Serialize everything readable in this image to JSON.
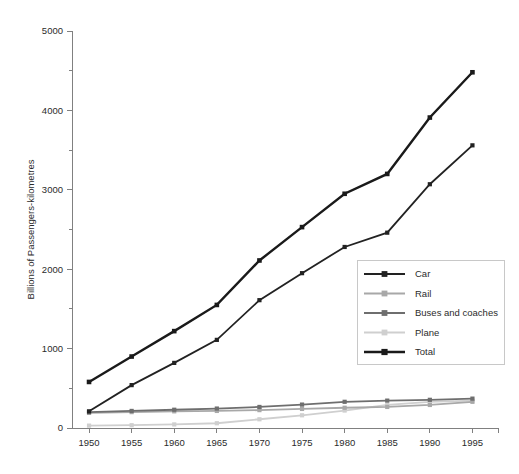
{
  "chart_data": {
    "type": "line",
    "title": "",
    "subtitle": "",
    "xlabel": "",
    "ylabel": "Billions of Passengers-kilometres",
    "x": [
      1950,
      1955,
      1960,
      1965,
      1970,
      1975,
      1980,
      1985,
      1990,
      1995
    ],
    "categories": [
      "1950",
      "1955",
      "1960",
      "1965",
      "1970",
      "1975",
      "1980",
      "1985",
      "1990",
      "1995"
    ],
    "xlim": [
      1948,
      1998
    ],
    "ylim": [
      0,
      5000
    ],
    "y_major_ticks": [
      0,
      1000,
      2000,
      3000,
      4000,
      5000
    ],
    "y_major_tick_labels": [
      "0",
      "1000",
      "2000",
      "3000",
      "4000",
      "5000"
    ],
    "y_minor_ticks": [
      500,
      1500,
      2500,
      3500,
      4500
    ],
    "x_ticks": [
      1950,
      1955,
      1960,
      1965,
      1970,
      1975,
      1980,
      1985,
      1990,
      1995,
      1998
    ],
    "x_tick_labels": [
      "1950",
      "1955",
      "1960",
      "1965",
      "1970",
      "1975",
      "1980",
      "1985",
      "1990",
      "1995",
      ""
    ],
    "grid": false,
    "legend_position": "center-right",
    "marker": "square",
    "series": [
      {
        "name": "Car",
        "color": "#222222",
        "line_width": 1.8,
        "marker_size": 4.2,
        "values": [
          210,
          540,
          820,
          1110,
          1610,
          1950,
          2280,
          2460,
          3070,
          3560
        ]
      },
      {
        "name": "Rail",
        "color": "#a8a8a8",
        "line_width": 1.8,
        "marker_size": 4.2,
        "values": [
          190,
          200,
          210,
          215,
          225,
          240,
          255,
          265,
          290,
          330
        ]
      },
      {
        "name": "Buses and coaches",
        "color": "#6e6e6e",
        "line_width": 1.8,
        "marker_size": 4.2,
        "values": [
          200,
          215,
          230,
          245,
          265,
          295,
          330,
          345,
          355,
          370
        ]
      },
      {
        "name": "Plane",
        "color": "#cfcfcf",
        "line_width": 1.8,
        "marker_size": 4.2,
        "values": [
          30,
          35,
          45,
          60,
          110,
          160,
          220,
          290,
          330,
          345
        ]
      },
      {
        "name": "Total",
        "color": "#1a1a1a",
        "line_width": 2.4,
        "marker_size": 4.6,
        "values": [
          580,
          900,
          1220,
          1550,
          2110,
          2530,
          2950,
          3200,
          3910,
          4480
        ]
      }
    ]
  },
  "legend": {
    "entries": [
      {
        "label": "Car"
      },
      {
        "label": "Rail"
      },
      {
        "label": "Buses and coaches"
      },
      {
        "label": "Plane"
      },
      {
        "label": "Total"
      }
    ]
  },
  "axes": {
    "y_title": "Billions of Passengers-kilometres"
  },
  "colors": {
    "axis": "#808080",
    "text": "#2b2b2b",
    "background": "#ffffff",
    "legend_border": "#c8c8c8"
  }
}
